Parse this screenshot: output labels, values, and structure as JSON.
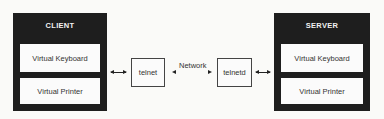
{
  "diagram": {
    "client": {
      "title": "CLIENT",
      "components": [
        "Virtual Keyboard",
        "Virtual Printer"
      ]
    },
    "server": {
      "title": "SERVER",
      "components": [
        "Virtual Keyboard",
        "Virtual Printer"
      ]
    },
    "client_process": "telnet",
    "server_process": "telnetd",
    "link_label": "Network"
  }
}
